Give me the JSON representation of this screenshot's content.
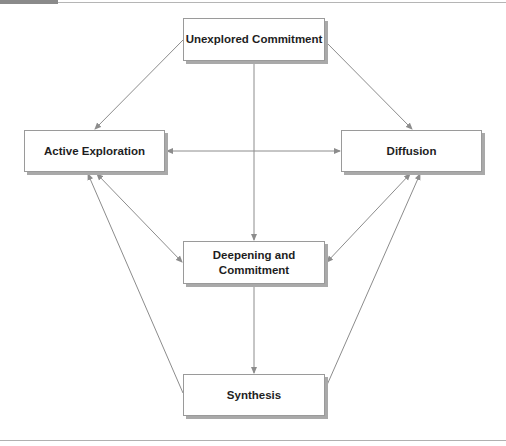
{
  "diagram": {
    "nodes": {
      "unexplored": {
        "label": "Unexplored Commitment"
      },
      "active": {
        "label": "Active Exploration"
      },
      "diffusion": {
        "label": "Diffusion"
      },
      "deepening": {
        "label": "Deepening and Commitment"
      },
      "synthesis": {
        "label": "Synthesis"
      }
    },
    "edges": [
      {
        "from": "Unexplored Commitment",
        "to": "Active Exploration",
        "direction": "forward"
      },
      {
        "from": "Unexplored Commitment",
        "to": "Diffusion",
        "direction": "forward"
      },
      {
        "from": "Unexplored Commitment",
        "to": "Deepening and Commitment",
        "direction": "forward"
      },
      {
        "from": "Active Exploration",
        "to": "Diffusion",
        "direction": "both"
      },
      {
        "from": "Active Exploration",
        "to": "Deepening and Commitment",
        "direction": "both"
      },
      {
        "from": "Diffusion",
        "to": "Deepening and Commitment",
        "direction": "both"
      },
      {
        "from": "Deepening and Commitment",
        "to": "Synthesis",
        "direction": "forward"
      },
      {
        "from": "Synthesis",
        "to": "Active Exploration",
        "direction": "forward"
      },
      {
        "from": "Synthesis",
        "to": "Diffusion",
        "direction": "forward"
      }
    ],
    "colors": {
      "line": "#8c8c8c",
      "box_border": "#9a9a9a",
      "box_shadow": "#a9a9a9",
      "text": "#1e1e1e"
    }
  }
}
